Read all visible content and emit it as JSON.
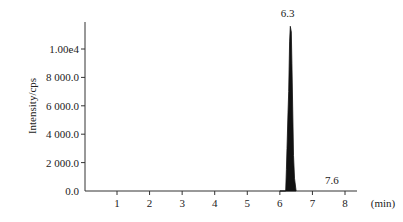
{
  "chart_data": {
    "type": "line",
    "title": "",
    "xlabel": "(min)",
    "ylabel": "Intensity/cps",
    "xlim": [
      0,
      8.3
    ],
    "ylim": [
      0,
      12000
    ],
    "x_ticks": [
      1,
      2,
      3,
      4,
      5,
      6,
      7,
      8
    ],
    "x_tick_labels": [
      "1",
      "2",
      "3",
      "4",
      "5",
      "6",
      "7",
      "8"
    ],
    "y_ticks": [
      0,
      2000,
      4000,
      6000,
      8000,
      10000
    ],
    "y_tick_labels": [
      "0.0",
      "2 000.0",
      "4 000.0",
      "6 000.0",
      "8 000.0",
      "1.00e4"
    ],
    "grid": false,
    "legend": null,
    "series": [
      {
        "name": "chromatogram",
        "x": [
          0.0,
          6.0,
          6.18,
          6.2,
          6.22,
          6.25,
          6.27,
          6.3,
          6.32,
          6.35,
          6.37,
          6.4,
          6.42,
          6.45,
          6.5,
          7.0,
          7.6,
          8.3
        ],
        "y": [
          0,
          0,
          0,
          1500,
          3000,
          5500,
          7000,
          10500,
          11600,
          11200,
          9000,
          5000,
          2500,
          900,
          0,
          0,
          0,
          0
        ]
      }
    ],
    "annotations": [
      {
        "text": "6.3",
        "x": 6.3,
        "y": 11600,
        "note": "main peak retention time"
      },
      {
        "text": "7.6",
        "x": 7.6,
        "y": 0,
        "note": "minor peak label"
      }
    ]
  }
}
